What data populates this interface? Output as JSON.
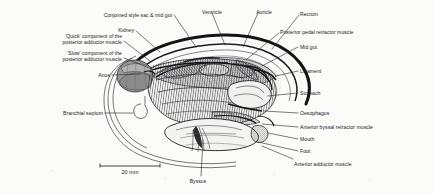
{
  "figure": {
    "background_color": "#fbfbf9",
    "ink_color": "#17171a",
    "leader_color": "#2b2b2e"
  },
  "scale_bar": {
    "label": "20 mm",
    "x_start": 100,
    "x_end": 160,
    "y": 166
  },
  "labels": [
    {
      "id": "conjoined-style-sac-mid-gut",
      "text": "Conjoined style sac & mid gut",
      "side": "left",
      "x": 172,
      "y": 12,
      "align": "right",
      "leader": [
        [
          174,
          15
        ],
        [
          196,
          47
        ]
      ]
    },
    {
      "id": "ventricle",
      "text": "Ventricle",
      "side": "left",
      "x": 222,
      "y": 9,
      "align": "right",
      "leader": [
        [
          212,
          13
        ],
        [
          225,
          45
        ]
      ]
    },
    {
      "id": "auricle",
      "text": "Auricle",
      "side": "left",
      "x": 272,
      "y": 9,
      "align": "right",
      "leader": [
        [
          258,
          13
        ],
        [
          243,
          47
        ]
      ]
    },
    {
      "id": "rectum",
      "text": "Rectum",
      "side": "right",
      "x": 300,
      "y": 11,
      "align": "left",
      "leader": [
        [
          299,
          15
        ],
        [
          272,
          49
        ]
      ]
    },
    {
      "id": "kidney",
      "text": "Kidney",
      "side": "left",
      "x": 134,
      "y": 27,
      "align": "right",
      "leader": [
        [
          136,
          31
        ],
        [
          160,
          52
        ]
      ]
    },
    {
      "id": "posterior-pedal-retractor-muscle",
      "text": "Posterior pedal retractor muscle",
      "side": "right",
      "x": 280,
      "y": 29,
      "align": "left",
      "leader": [
        [
          279,
          33
        ],
        [
          246,
          60
        ]
      ]
    },
    {
      "id": "quick-component-posterior-adductor",
      "text": "'Quick' component of the\nposterior adductor muscle",
      "side": "left",
      "x": 122,
      "y": 33,
      "align": "right",
      "leader": [
        [
          124,
          41
        ],
        [
          150,
          61
        ]
      ]
    },
    {
      "id": "mid-gut",
      "text": "Mid gut",
      "side": "right",
      "x": 300,
      "y": 44,
      "align": "left",
      "leader": [
        [
          298,
          47
        ],
        [
          262,
          66
        ]
      ]
    },
    {
      "id": "slow-component-posterior-adductor",
      "text": "'Slow' component of the\nposterior adductor muscle",
      "side": "left",
      "x": 122,
      "y": 50,
      "align": "right",
      "leader": [
        [
          124,
          58
        ],
        [
          152,
          69
        ]
      ]
    },
    {
      "id": "ligament",
      "text": "Ligament",
      "side": "right",
      "x": 300,
      "y": 68,
      "align": "left",
      "leader": [
        [
          298,
          71
        ],
        [
          276,
          76
        ]
      ]
    },
    {
      "id": "anus",
      "text": "Anus",
      "side": "left",
      "x": 110,
      "y": 72,
      "align": "right",
      "leader": [
        [
          112,
          75
        ],
        [
          140,
          74
        ]
      ]
    },
    {
      "id": "stomach",
      "text": "Stomach",
      "side": "right",
      "x": 300,
      "y": 90,
      "align": "left",
      "leader": [
        [
          298,
          93
        ],
        [
          268,
          96
        ]
      ]
    },
    {
      "id": "branchial-septum",
      "text": "Branchial septum",
      "side": "left",
      "x": 103,
      "y": 110,
      "align": "right",
      "leader": [
        [
          105,
          113
        ],
        [
          133,
          113
        ]
      ]
    },
    {
      "id": "oesophagus",
      "text": "Oesophagus",
      "side": "right",
      "x": 300,
      "y": 110,
      "align": "left",
      "leader": [
        [
          298,
          113
        ],
        [
          264,
          111
        ]
      ]
    },
    {
      "id": "anterior-byssal-retractor-muscle",
      "text": "Anterior byssal retractor muscle",
      "side": "right",
      "x": 300,
      "y": 124,
      "align": "left",
      "leader": [
        [
          298,
          127
        ],
        [
          262,
          124
        ]
      ]
    },
    {
      "id": "mouth",
      "text": "Mouth",
      "side": "right",
      "x": 300,
      "y": 136,
      "align": "left",
      "leader": [
        [
          298,
          139
        ],
        [
          268,
          133
        ]
      ]
    },
    {
      "id": "foot",
      "text": "Foot",
      "side": "right",
      "x": 300,
      "y": 148,
      "align": "left",
      "leader": [
        [
          298,
          151
        ],
        [
          258,
          142
        ]
      ]
    },
    {
      "id": "anterior-adductor-muscle",
      "text": "Anterior adductor muscle",
      "side": "right",
      "x": 294,
      "y": 161,
      "align": "left",
      "leader": [
        [
          293,
          159
        ],
        [
          262,
          146
        ]
      ]
    },
    {
      "id": "byssus",
      "text": "Byssus",
      "side": "below",
      "x": 198,
      "y": 178,
      "align": "center",
      "leader": [
        [
          201,
          176
        ],
        [
          203,
          140
        ]
      ]
    }
  ]
}
